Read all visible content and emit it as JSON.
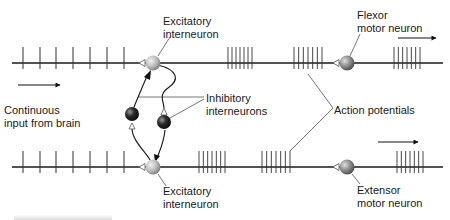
{
  "diagram": {
    "type": "neural-circuit",
    "colors": {
      "axon_line": "#1a1a1a",
      "spike": "#333333",
      "excitatory_neuron": "#b9b9b9",
      "motor_neuron": "#8a8a8a",
      "inhibitory_neuron": "#2b2b2b",
      "leader_line": "#666666",
      "synapse_open": "#ffffff"
    },
    "labels": {
      "input": {
        "line1": "Continuous",
        "line2": "input from brain"
      },
      "excitatory_top": {
        "line1": "Excitatory",
        "line2": "interneuron"
      },
      "excitatory_bottom": {
        "line1": "Excitatory",
        "line2": "interneuron"
      },
      "inhibitory": {
        "line1": "Inhibitory",
        "line2": "interneurons"
      },
      "flexor": {
        "line1": "Flexor",
        "line2": "motor neuron"
      },
      "extensor": {
        "line1": "Extensor",
        "line2": "motor neuron"
      },
      "action_potentials": "Action potentials"
    },
    "pathways": [
      {
        "name": "flexor-pathway",
        "axon_y": 63,
        "axon_x": [
          12,
          443
        ],
        "input_spikes_x": [
          23,
          40,
          56,
          73,
          90,
          107,
          124
        ],
        "burst_clusters_x": [
          [
            228,
            252
          ],
          [
            294,
            322
          ],
          [
            394,
            420
          ]
        ],
        "excitatory_interneuron": {
          "x": 153,
          "y": 63
        },
        "motor_neuron": {
          "x": 347,
          "y": 63
        },
        "direction_arrow": {
          "x1": 398,
          "x2": 436,
          "y": 38
        }
      },
      {
        "name": "extensor-pathway",
        "axon_y": 167,
        "axon_x": [
          12,
          443
        ],
        "input_spikes_x": [
          23,
          40,
          56,
          73,
          90,
          107,
          124
        ],
        "burst_clusters_x": [
          [
            199,
            225
          ],
          [
            262,
            290
          ],
          [
            397,
            423
          ]
        ],
        "excitatory_interneuron": {
          "x": 153,
          "y": 167
        },
        "motor_neuron": {
          "x": 347,
          "y": 167
        },
        "direction_arrow": {
          "x1": 378,
          "x2": 418,
          "y": 142
        }
      }
    ],
    "inhibitory_interneurons": [
      {
        "x": 132,
        "y": 114
      },
      {
        "x": 164,
        "y": 122
      }
    ],
    "input_arrow": {
      "x1": 18,
      "x2": 60,
      "y": 85
    }
  }
}
